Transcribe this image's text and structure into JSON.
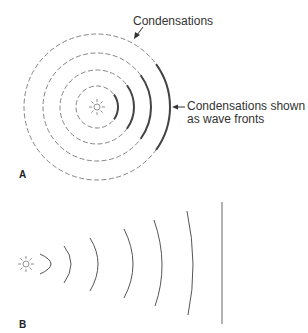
{
  "panels": {
    "a": {
      "letter": "A",
      "center": [
        97,
        107
      ],
      "radii": [
        21,
        37,
        54,
        73
      ],
      "labels": {
        "top": "Condensations",
        "right_line1": "Condensations shown",
        "right_line2": "as wave fronts"
      }
    },
    "b": {
      "letter": "B",
      "center": [
        26,
        264
      ],
      "arcs": [
        {
          "top": [
            40,
            254
          ],
          "apex": [
            51,
            264
          ],
          "bottom": [
            40,
            274
          ]
        },
        {
          "top": [
            64,
            246
          ],
          "apex": [
            71,
            264
          ],
          "bottom": [
            64,
            283
          ]
        },
        {
          "top": [
            90,
            238
          ],
          "apex": [
            98,
            264
          ],
          "bottom": [
            90,
            291
          ]
        },
        {
          "top": [
            124,
            229
          ],
          "apex": [
            133,
            264
          ],
          "bottom": [
            124,
            298
          ]
        },
        {
          "top": [
            154,
            220
          ],
          "apex": [
            162,
            264
          ],
          "bottom": [
            155,
            306
          ]
        },
        {
          "top": [
            187,
            211
          ],
          "apex": [
            193,
            264
          ],
          "bottom": [
            188,
            315
          ]
        }
      ],
      "plane_wave_x": 222,
      "plane_wave_y": [
        202,
        324
      ]
    }
  },
  "colors": {
    "line": "#555555",
    "dash": "#777777",
    "text": "#333333"
  }
}
